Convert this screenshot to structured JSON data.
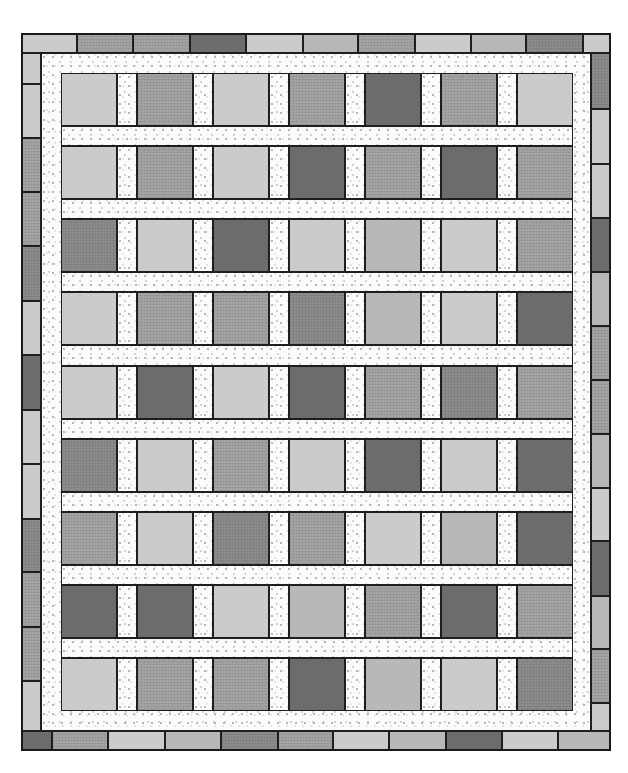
{
  "palette": {
    "L": "#cbcbcb",
    "LM": "#b8b8b8",
    "M": "#a4a4a4",
    "MD": "#8c8c8c",
    "D": "#6c6c6c",
    "sashing": "#fbfbfb",
    "outline": "#1e1e1e"
  },
  "geometry": {
    "outer": {
      "x": 21,
      "y": 33,
      "w": 590,
      "h": 718
    },
    "border_width": 20,
    "inner_frame_width": 20,
    "block_w": 56,
    "block_h": 53,
    "col_x": [
      61,
      137,
      213,
      289,
      365,
      441,
      517
    ],
    "row_y": [
      73,
      146,
      219,
      292,
      366,
      439,
      512,
      585,
      658
    ],
    "sash_color_key": "sashing"
  },
  "blocks": [
    [
      "L",
      "M",
      "L",
      "M",
      "D",
      "M",
      "L"
    ],
    [
      "L",
      "M",
      "L",
      "D",
      "M",
      "D",
      "M"
    ],
    [
      "MD",
      "L",
      "D",
      "L",
      "LM",
      "L",
      "M"
    ],
    [
      "L",
      "M",
      "M",
      "MD",
      "LM",
      "L",
      "D"
    ],
    [
      "L",
      "D",
      "L",
      "D",
      "M",
      "MD",
      "M"
    ],
    [
      "MD",
      "L",
      "M",
      "L",
      "D",
      "L",
      "D"
    ],
    [
      "M",
      "L",
      "MD",
      "M",
      "L",
      "LM",
      "D"
    ],
    [
      "D",
      "D",
      "L",
      "LM",
      "M",
      "D",
      "M"
    ],
    [
      "L",
      "M",
      "M",
      "D",
      "LM",
      "L",
      "MD"
    ]
  ],
  "border": {
    "top": [
      {
        "x": 21,
        "w": 56,
        "c": "L"
      },
      {
        "x": 77,
        "w": 56,
        "c": "M"
      },
      {
        "x": 133,
        "w": 57,
        "c": "M"
      },
      {
        "x": 190,
        "w": 56,
        "c": "D"
      },
      {
        "x": 246,
        "w": 57,
        "c": "L"
      },
      {
        "x": 303,
        "w": 55,
        "c": "LM"
      },
      {
        "x": 358,
        "w": 57,
        "c": "M"
      },
      {
        "x": 415,
        "w": 56,
        "c": "L"
      },
      {
        "x": 471,
        "w": 55,
        "c": "LM"
      },
      {
        "x": 526,
        "w": 57,
        "c": "MD"
      },
      {
        "x": 583,
        "w": 28,
        "c": "L"
      }
    ],
    "bottom": [
      {
        "x": 21,
        "w": 31,
        "c": "D"
      },
      {
        "x": 52,
        "w": 56,
        "c": "M"
      },
      {
        "x": 108,
        "w": 57,
        "c": "L"
      },
      {
        "x": 165,
        "w": 56,
        "c": "LM"
      },
      {
        "x": 221,
        "w": 57,
        "c": "MD"
      },
      {
        "x": 278,
        "w": 55,
        "c": "M"
      },
      {
        "x": 333,
        "w": 56,
        "c": "L"
      },
      {
        "x": 389,
        "w": 57,
        "c": "LM"
      },
      {
        "x": 446,
        "w": 56,
        "c": "D"
      },
      {
        "x": 502,
        "w": 56,
        "c": "L"
      },
      {
        "x": 558,
        "w": 53,
        "c": "LM"
      }
    ],
    "left": [
      {
        "y": 53,
        "h": 31,
        "c": "L"
      },
      {
        "y": 84,
        "h": 54,
        "c": "L"
      },
      {
        "y": 138,
        "h": 54,
        "c": "M"
      },
      {
        "y": 192,
        "h": 54,
        "c": "M"
      },
      {
        "y": 246,
        "h": 55,
        "c": "MD"
      },
      {
        "y": 301,
        "h": 54,
        "c": "L"
      },
      {
        "y": 355,
        "h": 55,
        "c": "D"
      },
      {
        "y": 410,
        "h": 54,
        "c": "L"
      },
      {
        "y": 464,
        "h": 55,
        "c": "L"
      },
      {
        "y": 519,
        "h": 53,
        "c": "MD"
      },
      {
        "y": 572,
        "h": 55,
        "c": "M"
      },
      {
        "y": 627,
        "h": 54,
        "c": "M"
      },
      {
        "y": 681,
        "h": 50,
        "c": "L"
      }
    ],
    "right": [
      {
        "y": 53,
        "h": 56,
        "c": "MD"
      },
      {
        "y": 109,
        "h": 55,
        "c": "L"
      },
      {
        "y": 164,
        "h": 54,
        "c": "L"
      },
      {
        "y": 218,
        "h": 54,
        "c": "D"
      },
      {
        "y": 272,
        "h": 54,
        "c": "LM"
      },
      {
        "y": 326,
        "h": 54,
        "c": "M"
      },
      {
        "y": 380,
        "h": 54,
        "c": "M"
      },
      {
        "y": 434,
        "h": 54,
        "c": "LM"
      },
      {
        "y": 488,
        "h": 53,
        "c": "L"
      },
      {
        "y": 541,
        "h": 55,
        "c": "D"
      },
      {
        "y": 596,
        "h": 53,
        "c": "LM"
      },
      {
        "y": 649,
        "h": 54,
        "c": "M"
      },
      {
        "y": 703,
        "h": 28,
        "c": "L"
      }
    ]
  }
}
